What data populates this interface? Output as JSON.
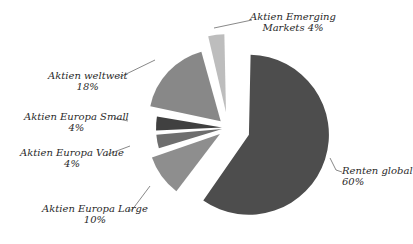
{
  "chart_data": {
    "type": "pie",
    "title": "",
    "exploded": true,
    "start_angle_deg": 0,
    "direction": "clockwise",
    "slices": [
      {
        "label": "Renten global",
        "value": 60,
        "display": "60%",
        "color": "#4d4d4d"
      },
      {
        "label": "Aktien Europa Large",
        "value": 10,
        "display": "10%",
        "color": "#8e8e8e"
      },
      {
        "label": "Aktien Europa Value",
        "value": 4,
        "display": "4%",
        "color": "#6e6e6e"
      },
      {
        "label": "Aktien Europa Small",
        "value": 4,
        "display": "4%",
        "color": "#404040"
      },
      {
        "label": "Aktien weltweit",
        "value": 18,
        "display": "18%",
        "color": "#888888"
      },
      {
        "label": "Aktien Emerging Markets",
        "value": 4,
        "display": "4%",
        "color": "#bdbdbd"
      }
    ],
    "legend": "none",
    "data_labels": "outside with leader lines"
  },
  "labels": {
    "renten": {
      "line1": "Renten global",
      "line2": "60%"
    },
    "large": {
      "line1": "Aktien Europa Large",
      "line2": "10%"
    },
    "value": {
      "line1": "Aktien Europa Value",
      "line2": "4%"
    },
    "small": {
      "line1": "Aktien Europa Small",
      "line2": "4%"
    },
    "weltweit": {
      "line1": "Aktien weltweit",
      "line2": "18%"
    },
    "emerging": {
      "line1": "Aktien Emerging",
      "line2": "Markets 4%"
    }
  }
}
